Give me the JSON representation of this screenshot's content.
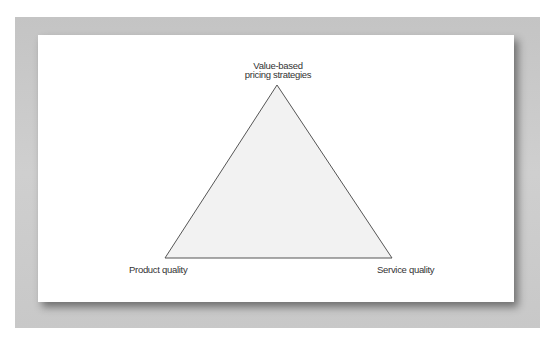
{
  "diagram": {
    "type": "triangle",
    "vertices": {
      "top": {
        "label_line1": "Value-based",
        "label_line2": "pricing strategies"
      },
      "bottom_left": {
        "label": "Product quality"
      },
      "bottom_right": {
        "label": "Service quality"
      }
    },
    "colors": {
      "triangle_fill": "#f2f2f2",
      "triangle_stroke": "#555555",
      "frame": "#c9c9c9",
      "panel": "#ffffff",
      "text": "#333333"
    }
  }
}
